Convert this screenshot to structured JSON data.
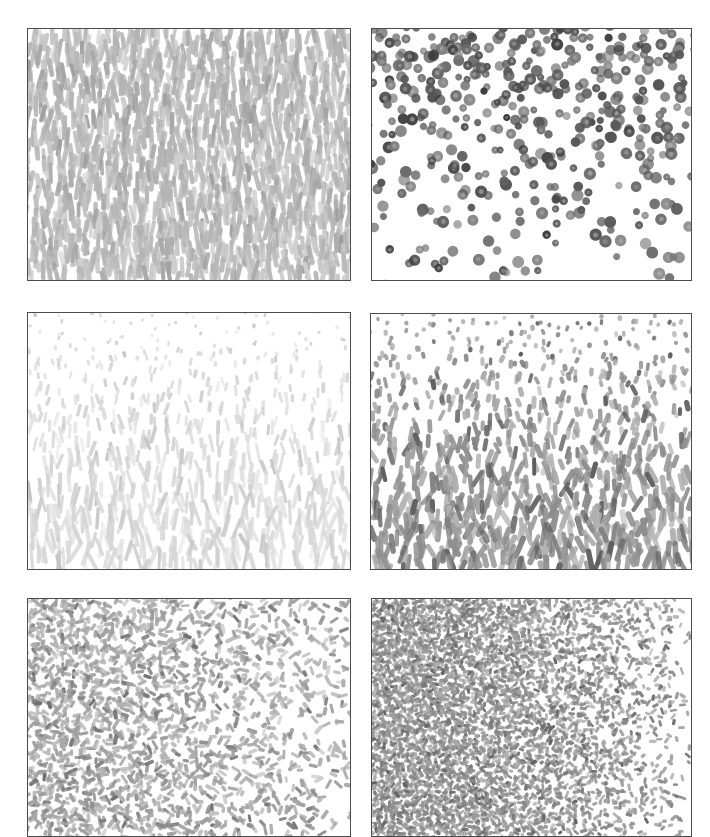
{
  "figure": {
    "background_color": "#ffffff",
    "width": 710,
    "height": 837,
    "border_color": "#4c4c4c",
    "rows": 3,
    "columns": 2,
    "panel_count": 6
  },
  "panels": [
    {
      "id": "panel-a",
      "label": "a",
      "position": "top-left",
      "rect": {
        "x": 27,
        "y": 28,
        "w": 324,
        "h": 253
      },
      "element_shape": "rod",
      "element_color": "#b4b4b4",
      "element_color_dark": "#9a9a9a",
      "element_color_light": "#d4d4d4",
      "element_length": 19,
      "element_width": 4.2,
      "orientation_mode": "vertical-aligned",
      "orientation_mean_deg": 90,
      "orientation_jitter_deg": 16,
      "density_gradient": "uniform",
      "count": 1500,
      "description": "Light gray near-vertical rods, uniform density"
    },
    {
      "id": "panel-b",
      "label": "b",
      "position": "top-right",
      "rect": {
        "x": 371,
        "y": 28,
        "w": 321,
        "h": 253
      },
      "element_shape": "disc",
      "element_color": "#565656",
      "element_color_dark": "#353535",
      "element_color_light": "#8a8a8a",
      "element_length": 9.6,
      "element_width": 9.6,
      "orientation_mode": "isotropic",
      "orientation_mean_deg": 0,
      "orientation_jitter_deg": 180,
      "density_gradient": "dense-top-sparse-bottom",
      "count": 780,
      "description": "Dark gray discs, density decreasing from top to bottom"
    },
    {
      "id": "panel-c",
      "label": "c",
      "position": "middle-left",
      "rect": {
        "x": 27,
        "y": 312,
        "w": 324,
        "h": 258
      },
      "element_shape": "dot-to-rod",
      "element_color": "#d6d6d6",
      "element_color_dark": "#c2c2c2",
      "element_color_light": "#eaeaea",
      "element_length": 22,
      "element_width": 3.6,
      "orientation_mode": "vertical-aligned",
      "orientation_mean_deg": 90,
      "orientation_jitter_deg": 20,
      "density_gradient": "dots-top-rods-bottom",
      "count": 900,
      "description": "Very light gray; round dots at top elongating into rods toward bottom"
    },
    {
      "id": "panel-d",
      "label": "d",
      "position": "middle-right",
      "rect": {
        "x": 370,
        "y": 313,
        "w": 322,
        "h": 257
      },
      "element_shape": "dot-to-rod",
      "element_color": "#8e8e8e",
      "element_color_dark": "#585858",
      "element_color_light": "#bcbcbc",
      "element_length": 20,
      "element_width": 5.0,
      "orientation_mode": "vertical-aligned",
      "orientation_mean_deg": 90,
      "orientation_jitter_deg": 30,
      "density_gradient": "dots-top-rods-bottom",
      "count": 1100,
      "description": "Medium gray; dots at top elongating into tilted rods toward bottom"
    },
    {
      "id": "panel-e",
      "label": "e",
      "position": "bottom-left",
      "rect": {
        "x": 27,
        "y": 598,
        "w": 324,
        "h": 239
      },
      "element_shape": "short-dash",
      "element_color": "#9e9e9e",
      "element_color_dark": "#6a6a6a",
      "element_color_light": "#c8c8c8",
      "element_length": 8.5,
      "element_width": 3.4,
      "orientation_mode": "isotropic",
      "orientation_mean_deg": 0,
      "orientation_jitter_deg": 180,
      "density_gradient": "dense-left-sparse-right",
      "count": 2600,
      "description": "Small randomly-oriented dashes, density decreasing left to right"
    },
    {
      "id": "panel-f",
      "label": "f",
      "position": "bottom-right",
      "rect": {
        "x": 371,
        "y": 598,
        "w": 321,
        "h": 239
      },
      "element_shape": "short-dash",
      "element_color": "#8a8a8a",
      "element_color_dark": "#5a5a5a",
      "element_color_light": "#b6b6b6",
      "element_length": 6.2,
      "element_width": 3.0,
      "orientation_mode": "isotropic",
      "orientation_mean_deg": 0,
      "orientation_jitter_deg": 180,
      "density_gradient": "very-dense-left-sparse-right",
      "count": 6200,
      "description": "Very dense fine marks on left fading to sparse dots on right"
    }
  ]
}
